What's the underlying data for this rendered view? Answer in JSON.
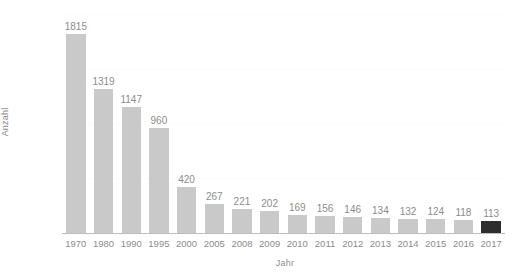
{
  "chart_data": {
    "type": "bar",
    "title": "",
    "xlabel": "Jahr",
    "ylabel": "Anzahl",
    "categories": [
      "1970",
      "1980",
      "1990",
      "1995",
      "2000",
      "2005",
      "2008",
      "2009",
      "2010",
      "2011",
      "2012",
      "2013",
      "2014",
      "2015",
      "2016",
      "2017"
    ],
    "values": [
      1815,
      1319,
      1147,
      960,
      420,
      267,
      221,
      202,
      169,
      156,
      146,
      134,
      132,
      124,
      118,
      113
    ],
    "value_labels": [
      "1815",
      "1319",
      "1147",
      "960",
      "420",
      "267",
      "221",
      "202",
      "169",
      "156",
      "146",
      "134",
      "132",
      "124",
      "118",
      "113"
    ],
    "ylim": [
      0,
      2000
    ],
    "yticks": [
      0,
      500,
      1000,
      1500,
      2000
    ],
    "ytick_labels": [
      "0",
      "500",
      "1000",
      "1500",
      "2000"
    ],
    "grid": true,
    "legend": "none",
    "bar_color": "#c9c9c9",
    "highlight_color": "#2e2e2e",
    "highlight_index": 15,
    "text_color": "#8c8c8c",
    "axis_color": "#bdbdbd",
    "background": "#ffffff"
  }
}
